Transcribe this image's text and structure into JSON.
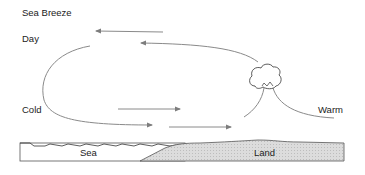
{
  "title": "Sea Breeze",
  "subtitle": "Day",
  "labels": {
    "cold": "Cold",
    "warm": "Warm",
    "sea": "Sea",
    "land": "Land"
  },
  "colors": {
    "arrow": "#8a8a8a",
    "outline": "#444444",
    "land_fill": "#d6d6d6",
    "text": "#222222"
  },
  "elements": {
    "cloud": "cumulus-cloud",
    "arrows": [
      "upper-return-flow-left",
      "upper-flow-left",
      "lower-flow-right-1",
      "lower-flow-right-2",
      "lower-flow-right-3"
    ]
  }
}
